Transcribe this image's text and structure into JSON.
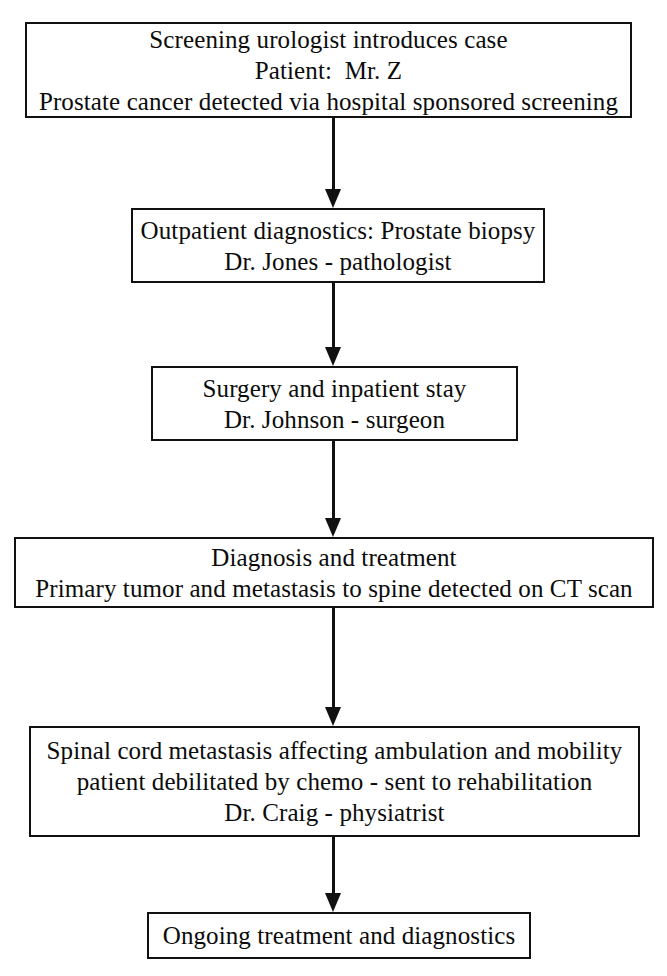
{
  "diagram": {
    "type": "flowchart",
    "orientation": "top-to-bottom",
    "colors": {
      "background": "#ffffff",
      "stroke": "#111111",
      "text": "#0b0b0b"
    },
    "nodes": [
      {
        "id": "node-1",
        "name": "screening-urologist-box",
        "lines": [
          "Screening urologist introduces case",
          "Patient:  Mr. Z",
          "Prostate cancer detected via hospital sponsored screening"
        ]
      },
      {
        "id": "node-2",
        "name": "outpatient-diagnostics-box",
        "lines": [
          "Outpatient diagnostics: Prostate biopsy",
          "Dr. Jones - pathologist"
        ]
      },
      {
        "id": "node-3",
        "name": "surgery-inpatient-box",
        "lines": [
          "Surgery and inpatient stay",
          "Dr. Johnson - surgeon"
        ]
      },
      {
        "id": "node-4",
        "name": "diagnosis-treatment-box",
        "lines": [
          "Diagnosis and treatment",
          "Primary tumor and metastasis to spine detected on CT scan"
        ]
      },
      {
        "id": "node-5",
        "name": "spinal-cord-metastasis-box",
        "lines": [
          "Spinal cord metastasis affecting ambulation and mobility",
          "patient debilitated by chemo - sent to rehabilitation",
          "Dr. Craig - physiatrist"
        ]
      },
      {
        "id": "node-6",
        "name": "ongoing-treatment-box",
        "lines": [
          "Ongoing treatment and diagnostics"
        ]
      }
    ],
    "connectors": [
      {
        "id": "conn-1",
        "name": "arrow-node1-to-node2",
        "from": "node-1",
        "to": "node-2",
        "glyph": "down-arrow"
      },
      {
        "id": "conn-2",
        "name": "arrow-node2-to-node3",
        "from": "node-2",
        "to": "node-3",
        "glyph": "down-arrow"
      },
      {
        "id": "conn-3",
        "name": "arrow-node3-to-node4",
        "from": "node-3",
        "to": "node-4",
        "glyph": "down-arrow"
      },
      {
        "id": "conn-4",
        "name": "arrow-node4-to-node5",
        "from": "node-4",
        "to": "node-5",
        "glyph": "down-arrow"
      },
      {
        "id": "conn-5",
        "name": "arrow-node5-to-node6",
        "from": "node-5",
        "to": "node-6",
        "glyph": "down-arrow"
      }
    ]
  }
}
